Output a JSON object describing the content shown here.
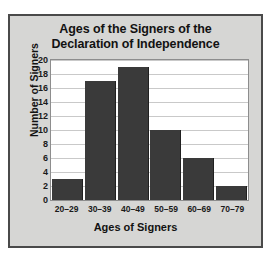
{
  "chart_data": {
    "type": "bar",
    "title": "Ages of the Signers of the Declaration of Independence",
    "title_lines": [
      "Ages of the Signers of the",
      "Declaration of Independence"
    ],
    "categories": [
      "20–29",
      "30–39",
      "40–49",
      "50–59",
      "60–69",
      "70–79"
    ],
    "values": [
      3,
      17,
      19,
      10,
      6,
      2
    ],
    "xlabel": "Ages of Signers",
    "ylabel": "Number of Signers",
    "ylim": [
      0,
      20
    ],
    "ytick_values": [
      0,
      2,
      4,
      6,
      8,
      10,
      12,
      14,
      16,
      18,
      20
    ],
    "ytick_labels": [
      "0",
      "2",
      "4",
      "6",
      "8",
      "10",
      "12",
      "14",
      "16",
      "18",
      "20"
    ],
    "grid": true,
    "legend": null,
    "colors": {
      "bar": "#3a3a3a",
      "figure_background": "#d6d6d4",
      "plot_background": "#ffffff",
      "gridline": "#c9c9c9",
      "border": "#4a4a4a",
      "text": "#121212"
    }
  }
}
